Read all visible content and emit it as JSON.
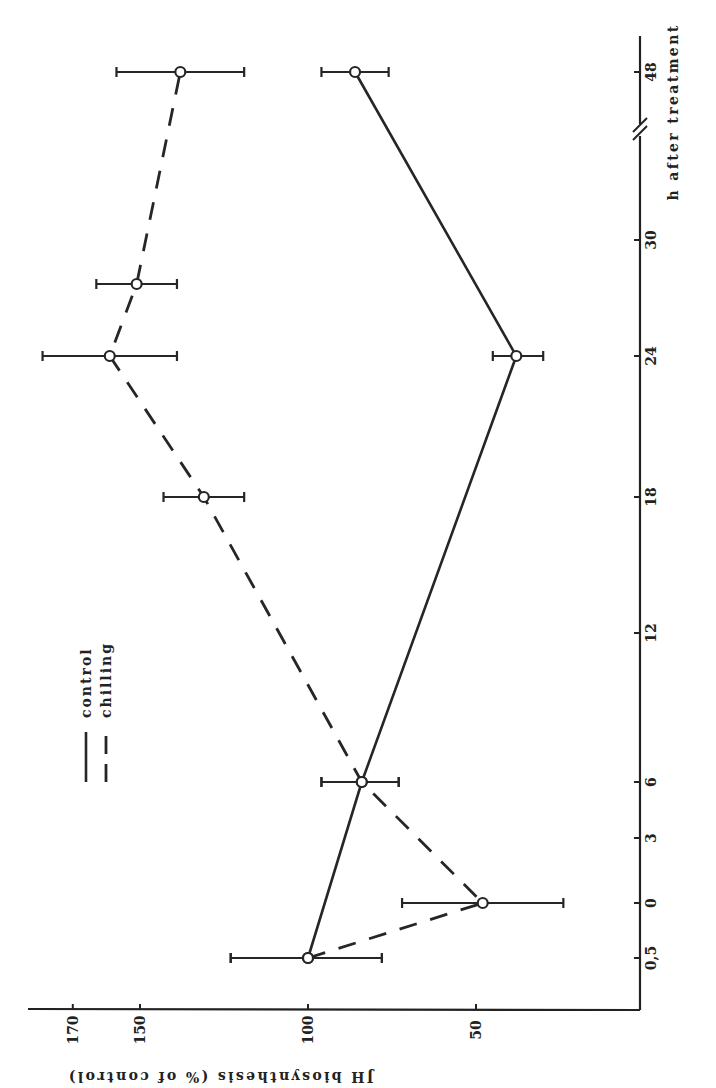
{
  "chart_data": {
    "type": "line",
    "orientation": "rotated 90 degrees clockwise (time axis vertical on right, value axis horizontal at bottom)",
    "title": "",
    "xlabel": "h after treatment",
    "ylabel": "JH biosynthesis (% of control)",
    "x_tick_labels": [
      "0,5",
      "0",
      "3",
      "6",
      "12",
      "18",
      "24",
      "30",
      "48"
    ],
    "x_axis_break": "between 30 and 48",
    "y_tick_labels": [
      "50",
      "100",
      "150",
      "170"
    ],
    "ylim": [
      20,
      175
    ],
    "grid": false,
    "legend": {
      "position": "upper-left (rotated)",
      "entries": [
        {
          "label": "control",
          "style": "solid"
        },
        {
          "label": "chilling",
          "style": "dashed"
        }
      ]
    },
    "series": [
      {
        "name": "control",
        "style": "solid",
        "points": [
          {
            "x": "0,5",
            "y": 100,
            "err_low": 78,
            "err_high": 123
          },
          {
            "x": "6",
            "y": 84,
            "err_low": 73,
            "err_high": 96
          },
          {
            "x": "24",
            "y": 38,
            "err_low": 30,
            "err_high": 45
          },
          {
            "x": "48",
            "y": 86,
            "err_low": 76,
            "err_high": 96
          }
        ]
      },
      {
        "name": "chilling",
        "style": "dashed",
        "points": [
          {
            "x": "0,5",
            "y": 100,
            "err_low": 78,
            "err_high": 123
          },
          {
            "x": "0",
            "y": 48,
            "err_low": 24,
            "err_high": 72
          },
          {
            "x": "6",
            "y": 84,
            "err_low": 73,
            "err_high": 96
          },
          {
            "x": "18",
            "y": 131,
            "err_low": 119,
            "err_high": 143
          },
          {
            "x": "24",
            "y": 159,
            "err_low": 139,
            "err_high": 179
          },
          {
            "x": "27",
            "y": 151,
            "err_low": 139,
            "err_high": 163
          },
          {
            "x": "48",
            "y": 138,
            "err_low": 119,
            "err_high": 157
          }
        ]
      }
    ]
  },
  "layout": {
    "time_axis_x": 640,
    "value_axis_y": 1010,
    "time_positions": {
      "0,5": 958,
      "0": 903,
      "3": 838,
      "6": 782,
      "12": 633,
      "18": 497,
      "24": 356,
      "27": 284,
      "30": 240,
      "48": 72
    },
    "value_ref": {
      "value": 100,
      "px": 308
    },
    "px_per_unit": 3.36,
    "break_y": 130
  }
}
